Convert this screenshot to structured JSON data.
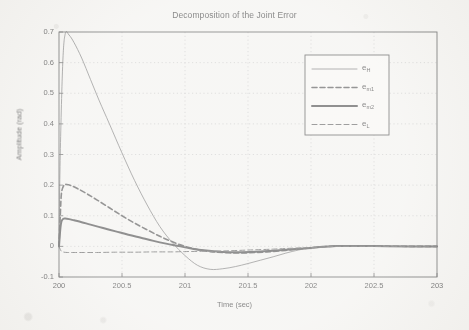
{
  "chart_data": {
    "type": "line",
    "title": "Decomposition of the Joint Error",
    "xlabel": "Time (sec)",
    "ylabel": "Amplitude (rad)",
    "xlim": [
      200,
      203
    ],
    "ylim": [
      -0.1,
      0.7
    ],
    "xticks": [
      200,
      200.5,
      201,
      201.5,
      202,
      202.5,
      203
    ],
    "xticklabels": [
      "200",
      "200.5",
      "201",
      "201.5",
      "202",
      "202.5",
      "203"
    ],
    "yticks": [
      -0.1,
      0,
      0.1,
      0.2,
      0.3,
      0.4,
      0.5,
      0.6,
      0.7
    ],
    "yticklabels": [
      "-0.1",
      "0",
      "0.1",
      "0.2",
      "0.3",
      "0.4",
      "0.5",
      "0.6",
      "0.7"
    ],
    "grid": true,
    "grid_style": "dotted",
    "legend_position": "upper right",
    "series": [
      {
        "name": "e_H",
        "label_base": "e",
        "label_sub": "H",
        "style": "solid",
        "width": 0.8,
        "color": "#707070",
        "x": [
          200.0,
          200.01,
          200.03,
          200.05,
          200.08,
          200.12,
          200.18,
          200.25,
          200.32,
          200.4,
          200.5,
          200.6,
          200.7,
          200.8,
          200.9,
          201.0,
          201.1,
          201.2,
          201.3,
          201.4,
          201.5,
          201.6,
          201.7,
          201.8,
          201.9,
          202.0,
          202.2,
          202.5,
          202.8,
          203.0
        ],
        "y": [
          0.0,
          0.3,
          0.6,
          0.695,
          0.69,
          0.665,
          0.615,
          0.545,
          0.475,
          0.4,
          0.305,
          0.215,
          0.135,
          0.065,
          0.012,
          -0.03,
          -0.062,
          -0.075,
          -0.073,
          -0.066,
          -0.056,
          -0.045,
          -0.034,
          -0.022,
          -0.012,
          -0.005,
          0.0,
          0.0,
          0.0,
          0.0
        ]
      },
      {
        "name": "e_m1",
        "label_base": "e",
        "label_sub": "m1",
        "style": "dashed",
        "width": 1.6,
        "color": "#5e5e5e",
        "x": [
          200.0,
          200.01,
          200.02,
          200.04,
          200.06,
          200.1,
          200.15,
          200.22,
          200.3,
          200.4,
          200.5,
          200.6,
          200.7,
          200.8,
          200.9,
          201.0,
          201.1,
          201.2,
          201.35,
          201.5,
          201.65,
          201.8,
          201.9,
          202.0,
          202.2,
          202.5,
          202.8,
          203.0
        ],
        "y": [
          0.0,
          0.1,
          0.175,
          0.2,
          0.202,
          0.198,
          0.188,
          0.172,
          0.152,
          0.126,
          0.1,
          0.076,
          0.054,
          0.033,
          0.015,
          0.0,
          -0.01,
          -0.017,
          -0.021,
          -0.021,
          -0.018,
          -0.013,
          -0.009,
          -0.005,
          0.001,
          0.001,
          0.0,
          0.0
        ]
      },
      {
        "name": "e_m2",
        "label_base": "e",
        "label_sub": "m2",
        "style": "solid",
        "width": 2.0,
        "color": "#555555",
        "x": [
          200.0,
          200.01,
          200.02,
          200.035,
          200.05,
          200.08,
          200.12,
          200.18,
          200.25,
          200.35,
          200.45,
          200.55,
          200.65,
          200.75,
          200.85,
          200.95,
          201.05,
          201.15,
          201.3,
          201.45,
          201.6,
          201.75,
          201.9,
          202.0,
          202.2,
          202.5,
          202.8,
          203.0
        ],
        "y": [
          0.0,
          0.055,
          0.082,
          0.09,
          0.091,
          0.089,
          0.085,
          0.079,
          0.071,
          0.06,
          0.049,
          0.038,
          0.028,
          0.018,
          0.009,
          0.001,
          -0.007,
          -0.013,
          -0.018,
          -0.019,
          -0.017,
          -0.013,
          -0.008,
          -0.005,
          0.001,
          0.001,
          0.0,
          0.0
        ]
      },
      {
        "name": "e_L",
        "label_base": "e",
        "label_sub": "L",
        "style": "dashed",
        "width": 1.0,
        "color": "#6b6b6b",
        "x": [
          200.0,
          200.01,
          200.02,
          200.04,
          200.07,
          200.12,
          200.2,
          200.3,
          200.45,
          200.6,
          200.75,
          200.9,
          201.0,
          201.15,
          201.3,
          201.5,
          201.7,
          201.85,
          202.0,
          202.2,
          202.5,
          202.8,
          203.0
        ],
        "y": [
          0.0,
          -0.01,
          -0.016,
          -0.019,
          -0.02,
          -0.02,
          -0.02,
          -0.02,
          -0.019,
          -0.019,
          -0.018,
          -0.018,
          -0.017,
          -0.016,
          -0.015,
          -0.012,
          -0.009,
          -0.006,
          -0.004,
          0.0,
          0.0,
          0.0,
          0.0
        ]
      }
    ]
  },
  "legend": {
    "entries": [
      {
        "base": "e",
        "sub": "H"
      },
      {
        "base": "e",
        "sub": "m1"
      },
      {
        "base": "e",
        "sub": "m2"
      },
      {
        "base": "e",
        "sub": "L"
      }
    ]
  },
  "colors": {
    "background": "#f3f2ef",
    "axis": "#555555",
    "grid": "#b9b9b9",
    "text": "#4b4b4b"
  }
}
